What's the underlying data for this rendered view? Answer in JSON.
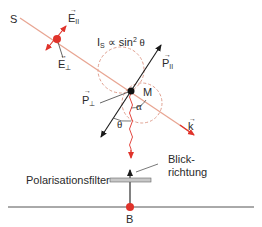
{
  "diagram": {
    "labels": {
      "source": "S",
      "e_parallel": "E",
      "e_parallel_sub": "II",
      "e_perp": "E",
      "e_perp_sub": "⊥",
      "intensity_formula_I": "I",
      "intensity_formula_sub": "S",
      "intensity_formula_rest": " ∝ sin",
      "intensity_formula_exp": "2",
      "intensity_formula_theta": " θ",
      "molecule": "M",
      "p_parallel": "P",
      "p_parallel_sub": "II",
      "p_perp": "P",
      "p_perp_sub": "⊥",
      "alpha": "α",
      "theta": "θ",
      "wave_vector": "k",
      "view_direction_line1": "Blick-",
      "view_direction_line2": "richtung",
      "polarizer": "Polarisationsfilter",
      "observer": "B"
    },
    "colors": {
      "beam": "#e8a592",
      "red": "#e0332b",
      "black": "#1a1a1a",
      "dashed": "#e0a090",
      "filter": "#c8c8c8",
      "ground": "#555555"
    }
  }
}
